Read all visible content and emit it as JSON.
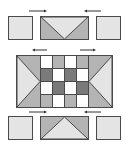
{
  "diagram": {
    "title": "",
    "colors": {
      "stroke": "#4a4a4a",
      "light": "#e4e4e4",
      "mid": "#b4b4b4",
      "dark": "#7a7a7a",
      "white": "#ffffff",
      "arrow": "#333333"
    },
    "top_row": {
      "left_square": {
        "fill": "light"
      },
      "middle_block": {
        "shape": "v-triangle-down",
        "outer": "mid",
        "inner": "light"
      },
      "right_square": {
        "fill": "light"
      },
      "arrows": [
        "right",
        "left"
      ]
    },
    "middle_row": {
      "left_panel": {
        "shape": "triangle-pointing-right",
        "outer": "mid",
        "inner": "light"
      },
      "checkerboard": [
        [
          "white",
          "mid",
          "white",
          "mid"
        ],
        [
          "dark",
          "white",
          "dark",
          "white"
        ],
        [
          "white",
          "dark",
          "white",
          "dark"
        ],
        [
          "mid",
          "white",
          "mid",
          "white"
        ]
      ],
      "right_panel": {
        "shape": "triangle-pointing-left",
        "outer": "mid",
        "inner": "light"
      },
      "arrows": [
        "left",
        "right"
      ]
    },
    "bottom_row": {
      "left_square": {
        "fill": "light"
      },
      "middle_block": {
        "shape": "triangle-up",
        "outer": "mid",
        "inner": "light"
      },
      "right_square": {
        "fill": "light"
      },
      "arrows": [
        "right",
        "left"
      ]
    }
  }
}
